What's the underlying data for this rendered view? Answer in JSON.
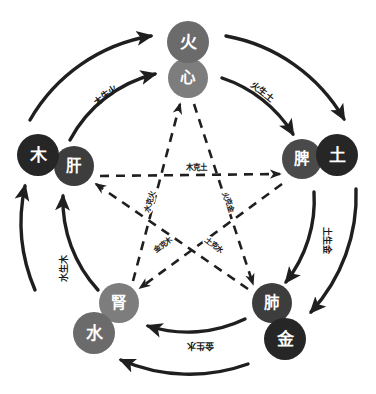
{
  "diagram": {
    "colors": {
      "element_circle": "#262626",
      "organ_circle": "#6e6e6e",
      "organ_circle_alt": "#8a8a8a",
      "stroke": "#1f1f1f",
      "text_on_circle": "#ffffff",
      "background": "#ffffff"
    },
    "nodes": [
      {
        "id": "fire",
        "element": "火",
        "organ": "心",
        "element_name": "fire-node",
        "organ_name": "heart-node",
        "ex": 188,
        "ey": 42,
        "ox": 188,
        "oy": 78,
        "er": 21,
        "or": 20,
        "ecolor": "#6b6b6b",
        "ocolor": "#7d7d7d"
      },
      {
        "id": "earth",
        "element": "土",
        "organ": "脾",
        "element_name": "earth-node",
        "organ_name": "spleen-node",
        "ex": 337,
        "ey": 155,
        "ox": 302,
        "oy": 159,
        "er": 21,
        "or": 20,
        "ecolor": "#262626",
        "ocolor": "#4a4a4a"
      },
      {
        "id": "metal",
        "element": "金",
        "organ": "肺",
        "element_name": "metal-node",
        "organ_name": "lung-node",
        "ex": 285,
        "ey": 339,
        "ox": 272,
        "oy": 303,
        "er": 21,
        "or": 20,
        "ecolor": "#262626",
        "ocolor": "#3d3d3d"
      },
      {
        "id": "water",
        "element": "水",
        "organ": "腎",
        "element_name": "water-node",
        "organ_name": "kidney-node",
        "ex": 94,
        "ey": 333,
        "ox": 119,
        "oy": 303,
        "er": 21,
        "or": 20,
        "ecolor": "#6b6b6b",
        "ocolor": "#7d7d7d"
      },
      {
        "id": "wood",
        "element": "木",
        "organ": "肝",
        "element_name": "wood-node",
        "organ_name": "liver-node",
        "ex": 38,
        "ey": 155,
        "ox": 74,
        "oy": 166,
        "er": 21,
        "or": 20,
        "ecolor": "#262626",
        "ocolor": "#3d3d3d"
      }
    ],
    "generating_cycle": {
      "name": "相生",
      "relations": [
        {
          "id": "wood-fire",
          "label": "木生火",
          "from": "wood",
          "to": "fire",
          "lx": 106,
          "ly": 95,
          "rot": -38
        },
        {
          "id": "fire-earth",
          "label": "火生土",
          "from": "fire",
          "to": "earth",
          "lx": 262,
          "ly": 92,
          "rot": 39
        },
        {
          "id": "earth-metal",
          "label": "土生金",
          "from": "earth",
          "to": "metal",
          "lx": 327,
          "ly": 240,
          "rot": 90
        },
        {
          "id": "metal-water",
          "label": "金生水",
          "from": "metal",
          "to": "water",
          "lx": 200,
          "ly": 346,
          "rot": 180
        },
        {
          "id": "water-wood",
          "label": "水生木",
          "from": "water",
          "to": "wood",
          "lx": 64,
          "ly": 268,
          "rot": -90
        }
      ]
    },
    "restraining_cycle": {
      "name": "相克",
      "relations": [
        {
          "id": "wood-earth",
          "label": "木克土",
          "from": "wood",
          "to": "earth",
          "lx": 196,
          "ly": 167,
          "rot": 0
        },
        {
          "id": "earth-water",
          "label": "土克水",
          "from": "earth",
          "to": "water",
          "lx": 214,
          "ly": 245,
          "rot": 38
        },
        {
          "id": "water-fire",
          "label": "水克火",
          "from": "water",
          "to": "fire",
          "lx": 150,
          "ly": 202,
          "rot": -72
        },
        {
          "id": "fire-metal",
          "label": "火克金",
          "from": "fire",
          "to": "metal",
          "lx": 228,
          "ly": 202,
          "rot": 72
        },
        {
          "id": "metal-wood",
          "label": "金克木",
          "from": "metal",
          "to": "wood",
          "lx": 163,
          "ly": 245,
          "rot": -38
        }
      ]
    }
  }
}
